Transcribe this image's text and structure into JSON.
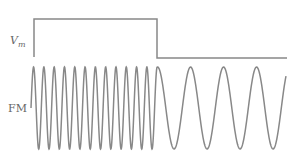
{
  "labels": {
    "modulating_signal": "V",
    "modulating_signal_sub": "m",
    "fm_signal": "FM"
  },
  "colors": {
    "line": "#888888",
    "text": "#666666"
  },
  "diagram": {
    "square_wave": {
      "x_start": 34,
      "x_step": 157,
      "x_end": 287,
      "y_high": 19,
      "y_low": 58,
      "y_base": 57
    },
    "fm_wave": {
      "x_start": 31,
      "x_switch": 157,
      "x_end": 286,
      "y_center": 108,
      "amplitude": 41,
      "high_freq_period": 10.3,
      "low_freq_period": 33
    }
  }
}
